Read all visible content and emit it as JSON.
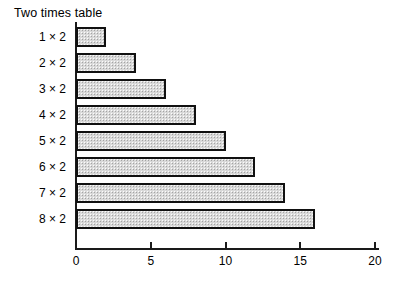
{
  "chart_data": {
    "type": "bar",
    "orientation": "horizontal",
    "title": "Two times table",
    "xlabel": "",
    "ylabel": "",
    "categories": [
      "1 × 2",
      "2 × 2",
      "3 × 2",
      "4 × 2",
      "5 × 2",
      "6 × 2",
      "7 × 2",
      "8 × 2"
    ],
    "values": [
      2,
      4,
      6,
      8,
      10,
      12,
      14,
      16
    ],
    "xlim": [
      0,
      20
    ],
    "xticks": [
      0,
      5,
      10,
      15,
      20
    ],
    "xtick_labels": [
      "0",
      "5",
      "10",
      "15",
      "20"
    ],
    "grid": false,
    "legend": null,
    "bar_fill_color": "#d9d9d9",
    "bar_edge_color": "#111111",
    "background_color": "#ffffff"
  }
}
